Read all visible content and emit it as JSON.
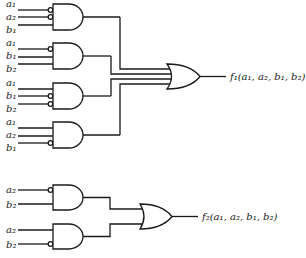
{
  "diagram": {
    "type": "logic-circuit",
    "circuit1": {
      "and_gates": [
        {
          "inputs": [
            {
              "var": "a",
              "sub": "1",
              "negated": true
            },
            {
              "var": "a",
              "sub": "2",
              "negated": true
            },
            {
              "var": "b",
              "sub": "1",
              "negated": false
            }
          ]
        },
        {
          "inputs": [
            {
              "var": "a",
              "sub": "1",
              "negated": true
            },
            {
              "var": "b",
              "sub": "1",
              "negated": false
            },
            {
              "var": "b",
              "sub": "2",
              "negated": false
            }
          ]
        },
        {
          "inputs": [
            {
              "var": "a",
              "sub": "1",
              "negated": false
            },
            {
              "var": "b",
              "sub": "1",
              "negated": true
            },
            {
              "var": "b",
              "sub": "2",
              "negated": true
            }
          ]
        },
        {
          "inputs": [
            {
              "var": "a",
              "sub": "1",
              "negated": false
            },
            {
              "var": "a",
              "sub": "2",
              "negated": false
            },
            {
              "var": "b",
              "sub": "1",
              "negated": true
            }
          ]
        }
      ],
      "or_gate_inputs": 4,
      "output": {
        "fn": "f",
        "sub": "1",
        "args": "(a₁, a₂, b₁, b₂)"
      }
    },
    "circuit2": {
      "and_gates": [
        {
          "inputs": [
            {
              "var": "a",
              "sub": "2",
              "negated": true
            },
            {
              "var": "b",
              "sub": "2",
              "negated": false
            }
          ]
        },
        {
          "inputs": [
            {
              "var": "a",
              "sub": "2",
              "negated": false
            },
            {
              "var": "b",
              "sub": "2",
              "negated": true
            }
          ]
        }
      ],
      "or_gate_inputs": 2,
      "output": {
        "fn": "f",
        "sub": "2",
        "args": "(a₁, a₂, b₁, b₂)"
      }
    }
  },
  "labels": {
    "c1g1": [
      "a₁",
      "a₂",
      "b₁"
    ],
    "c1g2": [
      "a₁",
      "b₁",
      "b₂"
    ],
    "c1g3": [
      "a₁",
      "b₁",
      "b₂"
    ],
    "c1g4": [
      "a₁",
      "a₂",
      "b₁"
    ],
    "c2g1": [
      "a₂",
      "b₂"
    ],
    "c2g2": [
      "a₂",
      "b₂"
    ],
    "f1": "f₁(a₁, a₂, b₁, b₂)",
    "f2": "f₂(a₁, a₂, b₁, b₂)"
  }
}
